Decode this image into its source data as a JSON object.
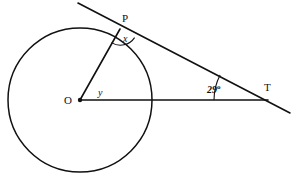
{
  "figure": {
    "type": "geometry-diagram",
    "background_color": "#ffffff",
    "stroke_color": "#111111"
  },
  "labels": {
    "center": "O",
    "tangent_point": "P",
    "external_point": "T",
    "angle_at_p": "x",
    "angle_at_o": "y",
    "angle_at_t_value": "29",
    "angle_at_t_degree_symbol": "o"
  },
  "geometry": {
    "circle": {
      "cx": 80,
      "cy": 100,
      "r": 72
    },
    "center_dot": {
      "cx": 80,
      "cy": 100,
      "r": 2.2
    },
    "radius_segment": {
      "x1": 80,
      "y1": 100,
      "x2": 120,
      "y2": 29
    },
    "base_segment": {
      "x1": 80,
      "y1": 100,
      "x2": 268,
      "y2": 100
    },
    "tangent_line": {
      "x1": 78,
      "y1": 3,
      "x2": 290,
      "y2": 113
    },
    "angle_arc_at_t": {
      "cx": 268,
      "cy": 100,
      "r": 54,
      "start_deg": 180,
      "end_deg": 207.4
    },
    "angle_arc_at_p": {
      "cx": 120,
      "cy": 29,
      "r": 16
    }
  }
}
